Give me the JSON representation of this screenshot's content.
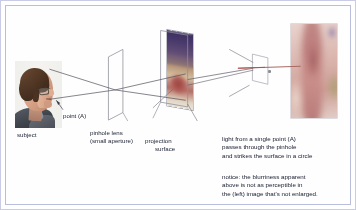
{
  "figure": {
    "border_color": "#c9cce4",
    "background": "#ffffff",
    "text_color": "#1b2030"
  },
  "labels": {
    "subject": "subject",
    "point_a": "point (A)",
    "pinhole_lens_line1": "pinhole lens",
    "pinhole_lens_line2": "(small aperture)",
    "projection_line1": "projection",
    "projection_line2": "surface"
  },
  "notes": {
    "light_paragraph": "light from a single point (A)\npasses through the pinhole\nand strikes the surface in a circle",
    "notice_paragraph": "notice: the blurriness apparent\nabove is not as perceptible in\nthe (left) image that's not enlarged."
  },
  "images": {
    "subject_photo": "photo of a man in profile facing right, wearing glasses, dark jacket",
    "projection_image": "inverted blurred projected image of the subject on the projection surface",
    "enlarged_image": "heavily blurred magnified detail of the projected image"
  },
  "icons": {
    "pinhole_lens": "pinhole-lens-icon",
    "projection_surface": "projection-surface-icon",
    "aperture_detail": "aperture-detail-icon",
    "pointer_line": "pointer-line-icon",
    "ray_lines": "light-ray-icon",
    "leader_line": "leader-line-icon"
  },
  "colors": {
    "ray": "#4a4a52",
    "pointer": "#b34a4a",
    "outline": "#9a9aa6",
    "frame": "#b9bedd"
  }
}
